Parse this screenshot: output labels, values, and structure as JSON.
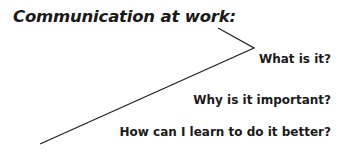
{
  "diagram": {
    "title": "Communication at work:",
    "questions": [
      {
        "label": "What is it?"
      },
      {
        "label": "Why is it important?"
      },
      {
        "label": "How can I learn to do it better?"
      }
    ],
    "connector": {
      "points": [
        [
          218,
          28
        ],
        [
          254,
          48
        ],
        [
          40,
          144
        ]
      ],
      "color": "#222222"
    }
  }
}
